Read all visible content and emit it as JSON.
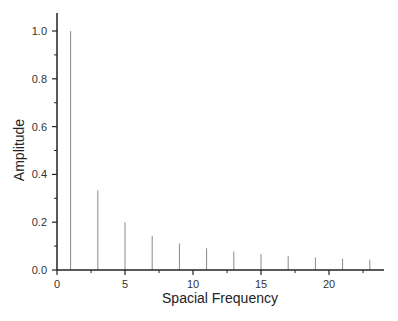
{
  "chart_data": {
    "type": "bar",
    "style": "stem",
    "title": "",
    "xlabel": "Spacial Frequency",
    "ylabel": "Amplitude",
    "xlim": [
      0,
      24
    ],
    "ylim": [
      0,
      1.05
    ],
    "x": [
      1,
      3,
      5,
      7,
      9,
      11,
      13,
      15,
      17,
      19,
      21,
      23
    ],
    "values": [
      1.0,
      0.333,
      0.2,
      0.143,
      0.111,
      0.091,
      0.077,
      0.067,
      0.059,
      0.053,
      0.048,
      0.043
    ],
    "x_ticks": [
      0,
      5,
      10,
      15,
      20
    ],
    "x_tick_labels": [
      "0",
      "5",
      "10",
      "15",
      "20"
    ],
    "x_minor_ticks": [
      2.5,
      7.5,
      12.5,
      17.5,
      22.5
    ],
    "y_ticks": [
      0.0,
      0.2,
      0.4,
      0.6,
      0.8,
      1.0
    ],
    "y_tick_labels": [
      "0.0",
      "0.2",
      "0.4",
      "0.6",
      "0.8",
      "1.0"
    ],
    "y_minor_ticks": [
      0.1,
      0.3,
      0.5,
      0.7,
      0.9
    ],
    "grid": false,
    "legend": null,
    "colors": {
      "axis": "#222222",
      "stem": "#8a8a8a"
    }
  }
}
